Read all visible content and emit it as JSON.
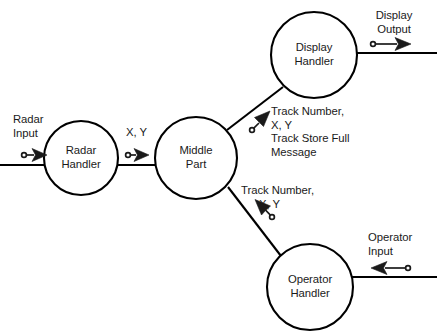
{
  "diagram": {
    "title_fragment": "structure chart showing processing of radar input",
    "nodes": [
      {
        "id": "radar-handler",
        "line1": "Radar",
        "line2": "Handler",
        "cx": 81,
        "cy": 158,
        "r": 37
      },
      {
        "id": "middle-part",
        "line1": "Middle",
        "line2": "Part",
        "cx": 196,
        "cy": 158,
        "r": 41
      },
      {
        "id": "display-handler",
        "line1": "Display",
        "line2": "Handler",
        "cx": 314,
        "cy": 55,
        "r": 43
      },
      {
        "id": "operator-handler",
        "line1": "Operator",
        "line2": "Handler",
        "cx": 310,
        "cy": 287,
        "r": 43
      }
    ],
    "flows": [
      {
        "id": "radar-input",
        "label_lines": [
          "Radar",
          "Input"
        ],
        "direction": "right",
        "target": "radar-handler"
      },
      {
        "id": "radar-to-middle",
        "label_lines": [
          "X, Y"
        ],
        "direction": "right",
        "source": "radar-handler",
        "target": "middle-part"
      },
      {
        "id": "middle-to-display",
        "label_lines": [
          "Track Number,",
          "X, Y",
          "Track Store Full",
          "Message"
        ],
        "direction": "up-right",
        "source": "middle-part",
        "target": "display-handler"
      },
      {
        "id": "operator-to-middle",
        "label_lines": [
          "Track Number,",
          "X, Y"
        ],
        "direction": "up-left",
        "source": "operator-handler",
        "target": "middle-part"
      },
      {
        "id": "display-output",
        "label_lines": [
          "Display",
          "Output"
        ],
        "direction": "right",
        "source": "display-handler"
      },
      {
        "id": "operator-input",
        "label_lines": [
          "Operator",
          "Input"
        ],
        "direction": "left",
        "target": "operator-handler"
      }
    ],
    "colors": {
      "stroke": "#000000",
      "text": "#1a1a1a",
      "background": "#ffffff"
    }
  }
}
